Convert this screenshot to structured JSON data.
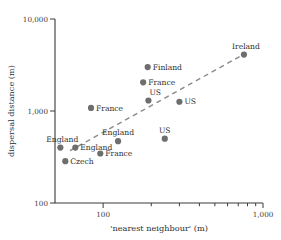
{
  "chart_data": {
    "type": "scatter",
    "title": "",
    "xlabel": "'nearest neighbour' (m)",
    "ylabel": "dispersal distance (m)",
    "xscale": "log",
    "yscale": "log",
    "xlim": [
      50,
      1000
    ],
    "ylim": [
      100,
      10000
    ],
    "grid": false,
    "legend": null,
    "x_tick_labels": [
      "100",
      "1,000"
    ],
    "x_tick_values": [
      100,
      1000
    ],
    "x_minor_ticks": [
      200,
      300,
      400,
      500,
      600,
      700,
      800,
      900
    ],
    "y_tick_labels": [
      "10,000",
      "1,000",
      "100"
    ],
    "y_tick_values": [
      10000,
      1000,
      100
    ],
    "points": [
      {
        "label": "Ireland",
        "x": 760,
        "y": 4100,
        "label_pos": "above-left"
      },
      {
        "label": "Finland",
        "x": 190,
        "y": 3000,
        "label_pos": "right"
      },
      {
        "label": "France",
        "x": 178,
        "y": 2050,
        "label_pos": "right"
      },
      {
        "label": "US",
        "x": 192,
        "y": 1300,
        "label_pos": "above-right"
      },
      {
        "label": "US",
        "x": 300,
        "y": 1260,
        "label_pos": "right"
      },
      {
        "label": "France",
        "x": 84,
        "y": 1080,
        "label_pos": "right"
      },
      {
        "label": "England",
        "x": 124,
        "y": 470,
        "label_pos": "above"
      },
      {
        "label": "US",
        "x": 243,
        "y": 500,
        "label_pos": "above"
      },
      {
        "label": "England",
        "x": 54,
        "y": 400,
        "label_pos": "above-left"
      },
      {
        "label": "England",
        "x": 67,
        "y": 400,
        "label_pos": "right"
      },
      {
        "label": "France",
        "x": 96,
        "y": 345,
        "label_pos": "right"
      },
      {
        "label": "Czech",
        "x": 58,
        "y": 285,
        "label_pos": "right"
      }
    ],
    "trend_line": {
      "style": "dashed",
      "x0": 62,
      "y0": 370,
      "x1": 780,
      "y1": 4250
    },
    "colors": {
      "point": "#6e6e6e",
      "axis": "#3a3a3a",
      "trend": "#8a8a8a",
      "text": "#2e2e2e",
      "background": "#ffffff"
    }
  }
}
